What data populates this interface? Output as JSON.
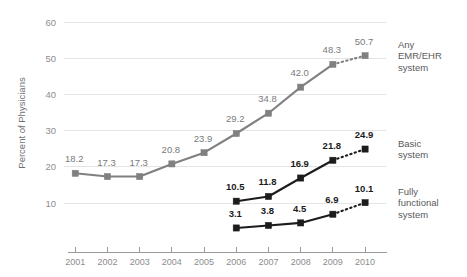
{
  "chart_data": {
    "type": "line",
    "title": "",
    "subtitle": "",
    "xlabel": "",
    "ylabel": "Percent of Physicians",
    "x": [
      "2001",
      "2002",
      "2003",
      "2004",
      "2005",
      "2006",
      "2007",
      "2008",
      "2009",
      "2010"
    ],
    "xlim": [
      2000.5,
      2010.5
    ],
    "ylim": [
      5,
      62
    ],
    "yticks": [
      10,
      20,
      30,
      40,
      50,
      60
    ],
    "ytick_labels": [
      "10",
      "20",
      "30",
      "40",
      "50",
      "60"
    ],
    "grid": "horizontal",
    "legend_position": "right",
    "series": [
      {
        "name": "Any EMR/EHR system",
        "legend_lines": [
          "Any",
          "EMR/EHR",
          "system"
        ],
        "color": "#808080",
        "label_color": "#7a7a7a",
        "marker": "square",
        "x": [
          "2001",
          "2002",
          "2003",
          "2004",
          "2005",
          "2006",
          "2007",
          "2008",
          "2009",
          "2010"
        ],
        "values": [
          18.2,
          17.3,
          17.3,
          20.8,
          23.9,
          29.2,
          34.8,
          42.0,
          48.3,
          50.7
        ],
        "value_labels": [
          "18.2",
          "17.3",
          "17.3",
          "20.8",
          "23.9",
          "29.2",
          "34.8",
          "42.0",
          "48.3",
          "50.7"
        ],
        "dashed_from": "2009",
        "dashed_to": "2010"
      },
      {
        "name": "Basic system",
        "legend_lines": [
          "Basic",
          "system"
        ],
        "color": "#1c1c1c",
        "label_color": "#1c1c1c",
        "marker": "square",
        "x": [
          "2006",
          "2007",
          "2008",
          "2009",
          "2010"
        ],
        "values": [
          10.5,
          11.8,
          16.9,
          21.8,
          24.9
        ],
        "value_labels": [
          "10.5",
          "11.8",
          "16.9",
          "21.8",
          "24.9"
        ],
        "dashed_from": "2009",
        "dashed_to": "2010"
      },
      {
        "name": "Fully functional system",
        "legend_lines": [
          "Fully",
          "functional",
          "system"
        ],
        "color": "#1c1c1c",
        "label_color": "#1c1c1c",
        "marker": "square",
        "x": [
          "2006",
          "2007",
          "2008",
          "2009",
          "2010"
        ],
        "values": [
          3.1,
          3.8,
          4.5,
          6.9,
          10.1
        ],
        "value_labels": [
          "3.1",
          "3.8",
          "4.5",
          "6.9",
          "10.1"
        ],
        "dashed_from": "2009",
        "dashed_to": "2010"
      }
    ]
  },
  "legend": {
    "items": [
      {
        "id": "any-emr-ehr-system",
        "lines": [
          "Any",
          "EMR/EHR",
          "system"
        ]
      },
      {
        "id": "basic-system",
        "lines": [
          "Basic",
          "system"
        ]
      },
      {
        "id": "fully-functional-system",
        "lines": [
          "Fully",
          "functional",
          "system"
        ]
      }
    ]
  },
  "axes": {
    "y_title": "Percent of Physicians"
  }
}
